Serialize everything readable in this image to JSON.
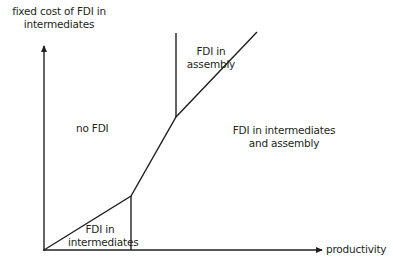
{
  "diagram": {
    "type": "regime-diagram",
    "axes": {
      "y_label_line1": "fixed cost of FDI in",
      "y_label_line2": "intermediates",
      "x_label": "productivity"
    },
    "regions": {
      "no_fdi": "no FDI",
      "fdi_assembly_line1": "FDI in",
      "fdi_assembly_line2": "assembly",
      "fdi_intermediates_line1": "FDI in",
      "fdi_intermediates_line2": "intermediates",
      "fdi_both_line1": "FDI in intermediates",
      "fdi_both_line2": "and assembly"
    },
    "colors": {
      "line": "#231f20",
      "text": "#231f20",
      "background": "#ffffff"
    }
  }
}
